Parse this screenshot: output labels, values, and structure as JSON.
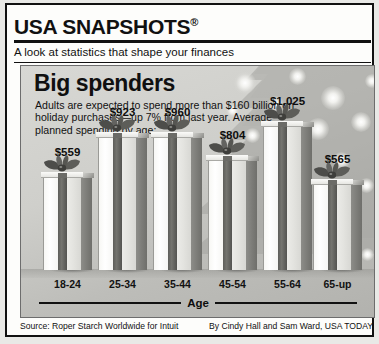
{
  "header": {
    "title": "USA SNAPSHOTS",
    "registered_mark": "®",
    "tagline": "A look at statistics that shape your finances"
  },
  "chart_panel": {
    "title": "Big spenders",
    "subtitle": "Adults are expected to spend more than $160 billion on holiday purchases—up 7% from last year. Average planned spending by age:",
    "axis_label": "Age"
  },
  "footer": {
    "source": "Source: Roper Starch Worldwide for Intuit",
    "credit": "By Cindy Hall and Sam Ward, USA TODAY"
  },
  "chart_data": {
    "type": "bar",
    "title": "Big spenders",
    "subtitle": "Adults are expected to spend more than $160 billion on holiday purchases—up 7% from last year. Average planned spending by age:",
    "xlabel": "Age",
    "ylabel": "",
    "categories": [
      "18-24",
      "25-34",
      "35-44",
      "45-54",
      "55-64",
      "65-up"
    ],
    "values": [
      559,
      923,
      960,
      804,
      1025,
      565
    ],
    "value_labels": [
      "$559",
      "$923",
      "$960",
      "$804",
      "$1,025",
      "$565"
    ],
    "unit": "US dollars",
    "grid": false,
    "legend": false,
    "bar_style": "gift-box",
    "bar_pixel_heights": [
      92,
      132,
      132,
      109,
      143,
      85
    ],
    "ylim": [
      0,
      1100
    ]
  },
  "colors": {
    "ink": "#111111",
    "panel_bg_light": "#d8d8d4",
    "panel_bg_dark": "#b2b2ae",
    "box_face": "#f4f4f1",
    "box_side": "#7c7c78",
    "ribbon": "#5e5e5a"
  }
}
